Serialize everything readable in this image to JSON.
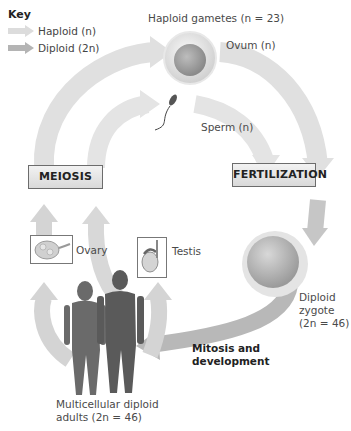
{
  "key": {
    "title": "Key",
    "items": [
      {
        "label": "Haploid (n)",
        "color": "#dcdcdc",
        "icon": "haploid-arrow-icon"
      },
      {
        "label": "Diploid (2n)",
        "color": "#b4b4b4",
        "icon": "diploid-arrow-icon"
      }
    ]
  },
  "labels": {
    "haploid_gametes": "Haploid gametes (n = 23)",
    "ovum": "Ovum (n)",
    "sperm": "Sperm (n)",
    "ovary": "Ovary",
    "testis": "Testis",
    "zygote_line1": "Diploid",
    "zygote_line2": "zygote",
    "zygote_line3": "(2n = 46)",
    "mitosis_line1": "Mitosis and",
    "mitosis_line2": "development",
    "adults_line1": "Multicellular diploid",
    "adults_line2": "adults (2n = 46)"
  },
  "stages": {
    "meiosis": "MEIOSIS",
    "fertilization": "FERTILIZATION"
  },
  "colors": {
    "haploid_arrow": "#dcdcdc",
    "diploid_arrow": "#b4b4b4",
    "box_border": "#6c6c6c"
  }
}
